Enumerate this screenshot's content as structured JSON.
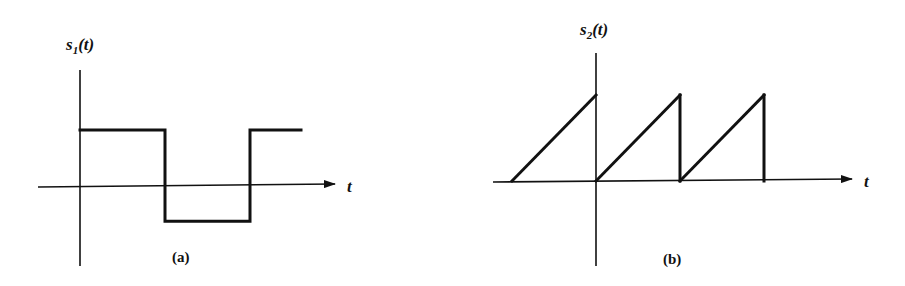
{
  "figure": {
    "panels": [
      {
        "id": "a",
        "caption": "(a)",
        "ylabel_base": "s",
        "ylabel_sub": "1",
        "ylabel_arg": "(t)",
        "xlabel": "t",
        "waveform": "square",
        "description": "Square wave: positive level for first half period after t=0, negative level for second half, then positive again",
        "segments": [
          {
            "t0": 0,
            "t1": 1,
            "level": 1
          },
          {
            "t0": 1,
            "t1": 2,
            "level": -0.6
          },
          {
            "t0": 2,
            "t1": 2.6,
            "level": 1
          }
        ]
      },
      {
        "id": "b",
        "caption": "(b)",
        "ylabel_base": "s",
        "ylabel_sub": "2",
        "ylabel_arg": "(t)",
        "xlabel": "t",
        "waveform": "sawtooth",
        "description": "Sawtooth wave: linear ramps from 0 to peak over each period, dropping back to zero; periods starting at t=-1, 0, 1",
        "ramps": [
          {
            "t0": -1,
            "t1": 0,
            "peak": 1
          },
          {
            "t0": 0,
            "t1": 1,
            "peak": 1
          },
          {
            "t0": 1,
            "t1": 2,
            "peak": 1
          }
        ]
      }
    ]
  }
}
